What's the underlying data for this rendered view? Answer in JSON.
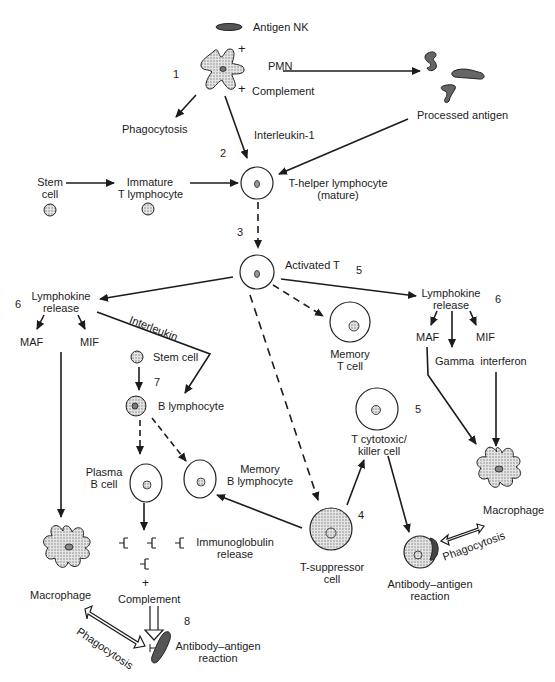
{
  "diagram": {
    "type": "immune-response-flowchart",
    "steps": [
      "1",
      "2",
      "3",
      "4",
      "5",
      "5",
      "6",
      "6",
      "7",
      "8"
    ],
    "labels": {
      "antigen_nk": "Antigen NK",
      "plus_1": "+",
      "pmn": "PMN",
      "plus_2": "+",
      "complement_top": "Complement",
      "phagocytosis_top": "Phagocytosis",
      "interleukin_1": "Interleukin-1",
      "processed_antigen": "Processed antigen",
      "stem_cell_line1": "Stem",
      "stem_cell_line2": "cell",
      "immature_line1": "Immature",
      "immature_line2": "T lymphocyte",
      "t_helper_line1": "T-helper lymphocyte",
      "t_helper_line2": "(mature)",
      "activated_t": "Activated T",
      "lymphokine_left_line1": "Lymphokine",
      "lymphokine_left_line2": "release",
      "maf_left": "MAF",
      "mif_left": "MIF",
      "interleukin": "Interleukin",
      "stem_cell_b": "Stem cell",
      "b_lymphocyte": "B lymphocyte",
      "memory_t_line1": "Memory",
      "memory_t_line2": "T cell",
      "lymphokine_right_line1": "Lymphokine",
      "lymphokine_right_line2": "release",
      "maf_right": "MAF",
      "mif_right": "MIF",
      "gamma_interferon": "Gamma  interferon",
      "t_cytotoxic_line1": "T cytotoxic/",
      "t_cytotoxic_line2": "killer cell",
      "plasma_line1": "Plasma",
      "plasma_line2": "B cell",
      "memory_b_line1": "Memory",
      "memory_b_line2": "B lymphocyte",
      "immunoglobulin_line1": "Immunoglobulin",
      "immunoglobulin_line2": "release",
      "plus_3": "+",
      "complement_bottom": "Complement",
      "macrophage_left": "Macrophage",
      "macrophage_right": "Macrophage",
      "t_suppressor_line1": "T-suppressor",
      "t_suppressor_line2": "cell",
      "phagocytosis_right": "Phagocytosis",
      "phagocytosis_bottom": "Phagocytosis",
      "ab_ag_right_line1": "Antibody–antigen",
      "ab_ag_right_line2": "reaction",
      "ab_ag_bottom_line1": "Antibody–antigen",
      "ab_ag_bottom_line2": "reaction"
    },
    "numbers": {
      "n1": "1",
      "n2": "2",
      "n3": "3",
      "n4": "4",
      "n5a": "5",
      "n5b": "5",
      "n6a": "6",
      "n6b": "6",
      "n7": "7",
      "n8": "8"
    },
    "colors": {
      "ink": "#1c1c1c",
      "cell_fill": "#ffffff",
      "stipple": "#9a9a9a",
      "background": "#ffffff"
    }
  }
}
